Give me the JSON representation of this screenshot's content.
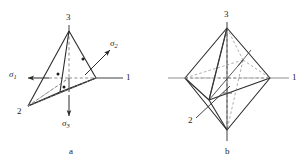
{
  "figure": {
    "background_color": "#ffffff",
    "stroke_color": "#2b2b2b",
    "dashed_color": "#6d6d6d",
    "text_color": "#1d1d1d"
  },
  "panel_a": {
    "caption": "a",
    "vertex_labels": {
      "axis1": "1",
      "axis2": "2",
      "axis3": "3"
    },
    "stress_labels": {
      "sigma1_symbol": "σ",
      "sigma1_sub": "1",
      "sigma2_symbol": "σ",
      "sigma2_sub": "2",
      "sigma3_symbol": "σ",
      "sigma3_sub": "3"
    }
  },
  "panel_b": {
    "caption": "b",
    "vertex_labels": {
      "axis1": "1",
      "axis2": "2",
      "axis3": "3"
    }
  }
}
